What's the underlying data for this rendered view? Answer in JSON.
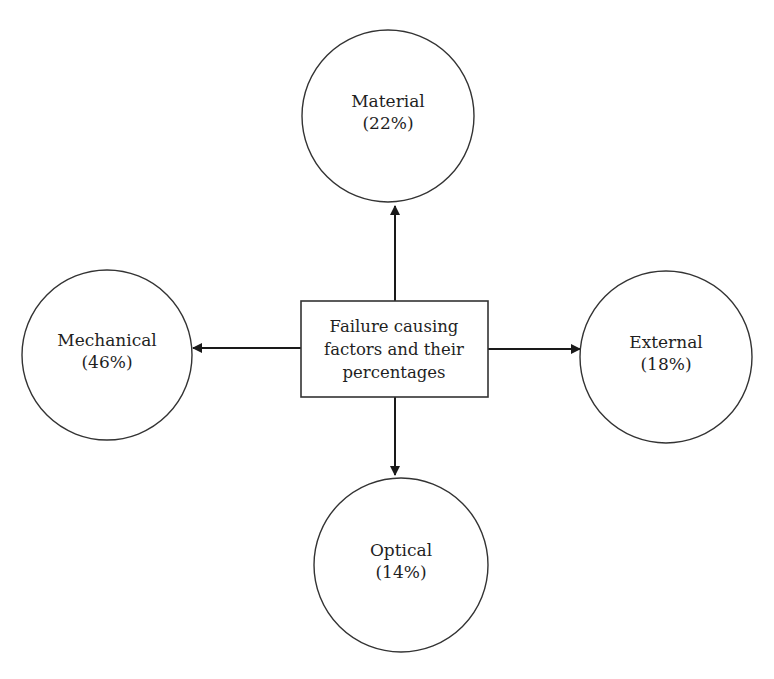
{
  "diagram": {
    "title": "Failure causing factors and their percentages",
    "center": {
      "lines": [
        "Failure causing",
        "factors and their",
        "percentages"
      ]
    },
    "nodes": [
      {
        "id": "material",
        "label": "Material",
        "percent": "(22%)",
        "value": 22,
        "position": "top"
      },
      {
        "id": "mechanical",
        "label": "Mechanical",
        "percent": "(46%)",
        "value": 46,
        "position": "left"
      },
      {
        "id": "external",
        "label": "External",
        "percent": "(18%)",
        "value": 18,
        "position": "right"
      },
      {
        "id": "optical",
        "label": "Optical",
        "percent": "(14%)",
        "value": 14,
        "position": "bottom"
      }
    ],
    "colors": {
      "stroke": "#333333",
      "text": "#1f1f1f",
      "background": "#ffffff"
    }
  }
}
